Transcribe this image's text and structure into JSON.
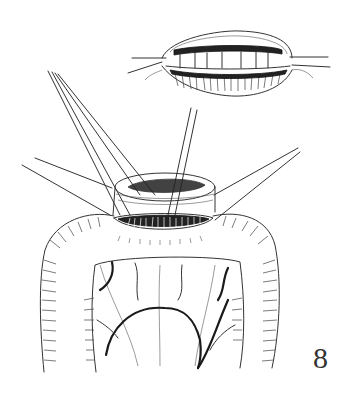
{
  "figure": {
    "number_label": "8",
    "colors": {
      "ink": "#333333",
      "background": "#ffffff"
    }
  }
}
